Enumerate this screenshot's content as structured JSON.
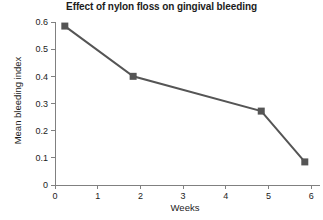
{
  "chart_data": {
    "type": "line",
    "title": "Effect of nylon floss on gingival bleeding",
    "xlabel": "Weeks",
    "ylabel": "Mean bleeding index",
    "x": [
      0.23,
      1.83,
      4.83,
      5.85
    ],
    "values": [
      0.585,
      0.4,
      0.272,
      0.085
    ],
    "series": [
      {
        "name": "Mean bleeding index",
        "x": [
          0.23,
          1.83,
          4.83,
          5.85
        ],
        "values": [
          0.585,
          0.4,
          0.272,
          0.085
        ]
      }
    ],
    "xlim": [
      0,
      6.2
    ],
    "ylim": [
      0,
      0.6
    ],
    "xticks": [
      0,
      1,
      2,
      3,
      4,
      5,
      6
    ],
    "xtick_labels": [
      "0",
      "1",
      "2",
      "3",
      "4",
      "5",
      "6"
    ],
    "yticks": [
      0,
      0.1,
      0.2,
      0.3,
      0.4,
      0.5,
      0.6
    ],
    "ytick_labels": [
      "0",
      "0.1",
      "0.2",
      "0.3",
      "0.4",
      "0.5",
      "0.6"
    ],
    "grid": false,
    "legend": false,
    "marker": "square",
    "line_color": "#555555",
    "marker_color": "#555555",
    "axis_color": "#808080",
    "background": "#ffffff"
  }
}
